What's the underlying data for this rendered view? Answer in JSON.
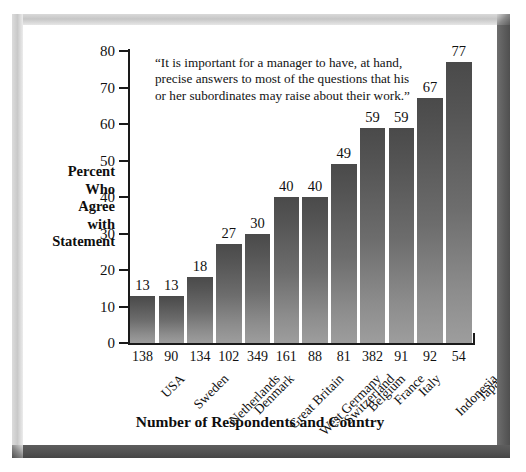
{
  "page_header": "",
  "chart_data": {
    "type": "bar",
    "title": "",
    "quote": "“It is important for a manager to have, at hand, precise answers to most of the questions that his or her subordinates may raise about their work.”",
    "xlabel": "Number of Respondents and Country",
    "ylabel": "Percent Who Agree with Statement",
    "ylabel_lines": [
      "Percent",
      "Who",
      "Agree",
      "with",
      "Statement"
    ],
    "ylim": [
      0,
      80
    ],
    "ytick_step": 10,
    "yticks": [
      80,
      70,
      60,
      50,
      40,
      30,
      20,
      10,
      0
    ],
    "grid": false,
    "legend": null,
    "categories": [
      "USA",
      "Sweden",
      "Netherlands",
      "Denmark",
      "Great Britain",
      "West Germany",
      "Switzerland",
      "Belgium",
      "France",
      "Italy",
      "Indonesia",
      "Japan"
    ],
    "values": [
      13,
      13,
      18,
      27,
      30,
      40,
      40,
      49,
      59,
      59,
      67,
      77
    ],
    "respondents": [
      138,
      90,
      134,
      102,
      349,
      161,
      88,
      81,
      382,
      91,
      92,
      54
    ],
    "bar_color_top": "#4a4a4a",
    "bar_color_bottom": "#9d9d9d",
    "axis_color": "#1a1a1a"
  }
}
